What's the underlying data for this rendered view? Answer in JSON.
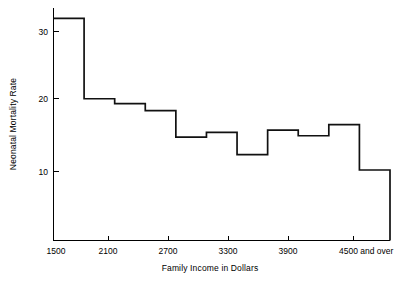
{
  "chart_data": {
    "type": "bar",
    "title": "",
    "subtitle": "",
    "xlabel": "Family  Income in Dollars",
    "ylabel": "Neonatal Mortality Rate",
    "grid": false,
    "legend": false,
    "legend_position": "none",
    "xlim": [
      1500,
      4800
    ],
    "ylim": [
      1.2,
      34.5
    ],
    "x_tick_labels": [
      "1500",
      "2100",
      "2700",
      "3300",
      "3900",
      "4500 and over"
    ],
    "x_tick_values": [
      1500,
      2100,
      2700,
      3300,
      3900,
      4500
    ],
    "y_tick_labels": [
      "10",
      "20",
      "30"
    ],
    "y_tick_values": [
      10,
      20,
      30
    ],
    "bin_width": 300,
    "categories": [
      "1500-1800",
      "1800-2100",
      "2100-2400",
      "2400-2700",
      "2700-3000",
      "3000-3300",
      "3300-3600",
      "3600-3900",
      "3900-4200",
      "4200-4500",
      "4500 and over"
    ],
    "bin_starts": [
      1500,
      1800,
      2100,
      2400,
      2700,
      3000,
      3300,
      3600,
      3900,
      4200,
      4500
    ],
    "bin_ends": [
      1800,
      2100,
      2400,
      2700,
      3000,
      3300,
      3600,
      3900,
      4200,
      4500,
      4800
    ],
    "values": [
      33.0,
      21.5,
      20.8,
      19.8,
      16.0,
      16.7,
      13.5,
      17.0,
      16.2,
      17.8,
      11.3
    ],
    "series": [
      {
        "name": "Neonatal Mortality Rate",
        "values": [
          33.0,
          21.5,
          20.8,
          19.8,
          16.0,
          16.7,
          13.5,
          17.0,
          16.2,
          17.8,
          11.3
        ]
      }
    ]
  },
  "axes": {
    "x_label_text": "Family  Income in Dollars",
    "y_label_text": "Neonatal Mortality Rate",
    "y_ticks": [
      {
        "label": "30",
        "value": 30
      },
      {
        "label": "20",
        "value": 20
      },
      {
        "label": "10",
        "value": 10
      }
    ],
    "x_ticks": [
      {
        "label": "1500",
        "value": 1500
      },
      {
        "label": "2100",
        "value": 2100
      },
      {
        "label": "2700",
        "value": 2700
      },
      {
        "label": "3300",
        "value": 3300
      },
      {
        "label": "3900",
        "value": 3900
      },
      {
        "label": "4500 and over",
        "value": 4500
      }
    ]
  },
  "colors": {
    "background": "#ffffff",
    "line": "#111111",
    "axis": "#000000",
    "text": "#000000"
  }
}
